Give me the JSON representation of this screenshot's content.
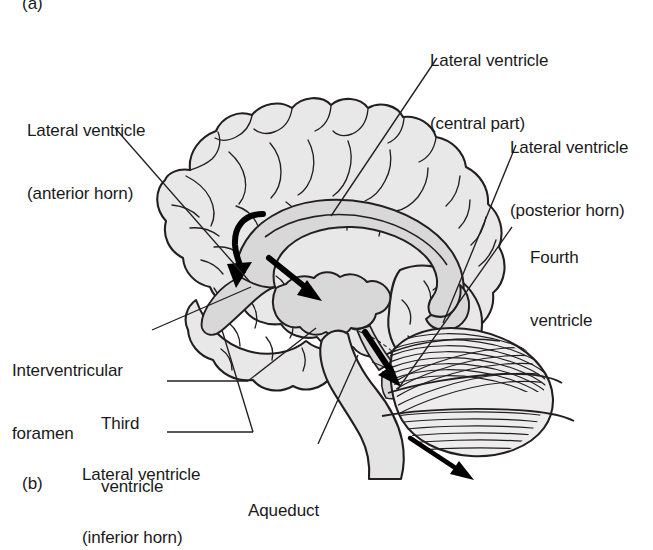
{
  "figure": {
    "panel_a_tag": "(a)",
    "panel_b_tag": "(b)"
  },
  "labels": {
    "lateral_ventricle_anterior_horn": {
      "line1": "Lateral ventricle",
      "line2": "(anterior horn)"
    },
    "lateral_ventricle_central_part": {
      "line1": "Lateral ventricle",
      "line2": "(central part)"
    },
    "lateral_ventricle_posterior_horn": {
      "line1": "Lateral ventricle",
      "line2": "(posterior horn)"
    },
    "fourth_ventricle": {
      "line1": "Fourth",
      "line2": "ventricle"
    },
    "interventricular_foramen": {
      "line1": "Interventricular",
      "line2": "foramen"
    },
    "third_ventricle": {
      "line1": "Third",
      "line2": "ventricle"
    },
    "lateral_ventricle_inferior_horn": {
      "line1": "Lateral ventricle",
      "line2": "(inferior horn)"
    },
    "aqueduct": {
      "line1": "Aqueduct"
    }
  },
  "colors": {
    "ink": "#1a1a1a",
    "stroke": "#231f20",
    "cortex_fill": "#e6e6e6",
    "ventricle_fill": "#d6d6d6",
    "cerebellum_fill": "#ebebeb",
    "background": "#ffffff",
    "arrow_fill": "#000000"
  },
  "icon_names": [
    "curved-arrow-icon",
    "straight-arrow-icon",
    "leader-line-icon"
  ]
}
